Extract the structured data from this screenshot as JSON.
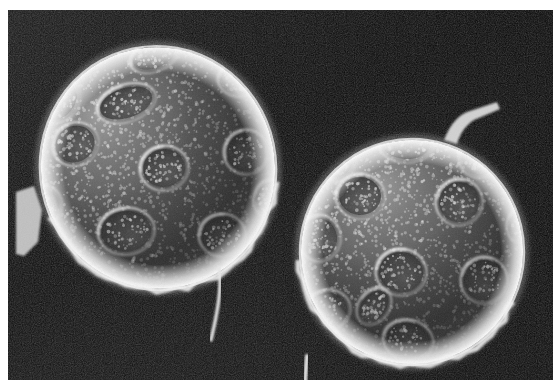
{
  "figure": {
    "kind": "scanning-electron-micrograph",
    "caption": "",
    "frame": {
      "x": 8,
      "y": 10,
      "width": 545,
      "height": 370
    },
    "page_background": "#ffffff"
  },
  "palette": {
    "page": "#ffffff",
    "background_dark": "#0a0a0a",
    "background_mid": "#1d1d1d",
    "background_lower_left": "#2e2e2e",
    "grain_body_dark": "#3a3a3a",
    "grain_body_mid": "#6f6f6f",
    "grain_highlight": "#d8d8d8",
    "grain_rim": "#f2f2f2",
    "pore_floor": "#4a4a4a",
    "pore_rim": "#e6e6e6",
    "filament": "#e8e8e8",
    "spine": "#dcdcdc"
  },
  "background": {
    "name": "specimen-stub-background",
    "top_left": "#161616",
    "top_right": "#070707",
    "bottom_left": "#303030",
    "bottom_right": "#101010",
    "noise_opacity": 0.22
  },
  "grains": [
    {
      "id": "grain-left",
      "label": "left pollen grain",
      "cx": 150,
      "cy": 158,
      "rx": 118,
      "ry": 122,
      "rotation": -12,
      "light_from": "upper-left",
      "rim_width": 11,
      "pores": [
        {
          "cx": 146,
          "cy": 46,
          "rx": 22,
          "ry": 12,
          "rot": -8,
          "depth": 0.72
        },
        {
          "cx": 52,
          "cy": 92,
          "rx": 20,
          "ry": 14,
          "rot": -38,
          "depth": 0.55
        },
        {
          "cx": 230,
          "cy": 70,
          "rx": 17,
          "ry": 13,
          "rot": 24,
          "depth": 0.6
        },
        {
          "cx": 118,
          "cy": 93,
          "rx": 27,
          "ry": 15,
          "rot": -6,
          "depth": 0.8
        },
        {
          "cx": 67,
          "cy": 134,
          "rx": 20,
          "ry": 18,
          "rot": -12,
          "depth": 0.78
        },
        {
          "cx": 156,
          "cy": 158,
          "rx": 21,
          "ry": 19,
          "rot": 6,
          "depth": 0.84
        },
        {
          "cx": 238,
          "cy": 142,
          "rx": 19,
          "ry": 19,
          "rot": 0,
          "depth": 0.7
        },
        {
          "cx": 33,
          "cy": 196,
          "rx": 18,
          "ry": 17,
          "rot": -20,
          "depth": 0.62
        },
        {
          "cx": 118,
          "cy": 221,
          "rx": 25,
          "ry": 20,
          "rot": 8,
          "depth": 0.82
        },
        {
          "cx": 214,
          "cy": 225,
          "rx": 20,
          "ry": 18,
          "rot": 14,
          "depth": 0.72
        },
        {
          "cx": 262,
          "cy": 188,
          "rx": 13,
          "ry": 16,
          "rot": 30,
          "depth": 0.45
        }
      ],
      "appendages": [
        {
          "type": "filament",
          "name": "basal-filament-left",
          "path": "M 211 258 C 214 278 210 300 203 330",
          "width": 3.4
        },
        {
          "type": "torn-flap",
          "name": "exine-fragment-left-edge",
          "path": "M 8 182 L 26 176 L 34 200 L 30 232 L 16 246 L 8 244 Z"
        }
      ]
    },
    {
      "id": "grain-right",
      "label": "right pollen grain",
      "cx": 404,
      "cy": 242,
      "rx": 112,
      "ry": 113,
      "rotation": 8,
      "light_from": "upper-left",
      "rim_width": 12,
      "pores": [
        {
          "cx": 398,
          "cy": 134,
          "rx": 24,
          "ry": 15,
          "rot": -6,
          "depth": 0.68
        },
        {
          "cx": 328,
          "cy": 153,
          "rx": 17,
          "ry": 14,
          "rot": -30,
          "depth": 0.58
        },
        {
          "cx": 470,
          "cy": 150,
          "rx": 16,
          "ry": 14,
          "rot": 22,
          "depth": 0.52
        },
        {
          "cx": 352,
          "cy": 186,
          "rx": 21,
          "ry": 19,
          "rot": -4,
          "depth": 0.8
        },
        {
          "cx": 451,
          "cy": 192,
          "rx": 20,
          "ry": 20,
          "rot": 4,
          "depth": 0.74
        },
        {
          "cx": 311,
          "cy": 228,
          "rx": 18,
          "ry": 20,
          "rot": -14,
          "depth": 0.7
        },
        {
          "cx": 516,
          "cy": 213,
          "rx": 13,
          "ry": 17,
          "rot": 18,
          "depth": 0.44
        },
        {
          "cx": 393,
          "cy": 262,
          "rx": 22,
          "ry": 20,
          "rot": 2,
          "depth": 0.86
        },
        {
          "cx": 476,
          "cy": 270,
          "rx": 20,
          "ry": 20,
          "rot": 10,
          "depth": 0.76
        },
        {
          "cx": 319,
          "cy": 300,
          "rx": 20,
          "ry": 17,
          "rot": -18,
          "depth": 0.66
        },
        {
          "cx": 400,
          "cy": 330,
          "rx": 22,
          "ry": 17,
          "rot": 6,
          "depth": 0.64
        },
        {
          "cx": 366,
          "cy": 296,
          "rx": 12,
          "ry": 17,
          "rot": 28,
          "depth": 0.55
        }
      ],
      "appendages": [
        {
          "type": "spine",
          "name": "apical-spine-right",
          "path": "M 436 130 C 443 112 452 104 462 101 L 489 92 L 492 99 L 466 110 C 457 116 452 124 449 134 Z"
        },
        {
          "type": "filament",
          "name": "basal-filament-right",
          "path": "M 299 346 C 298 358 297 368 297 379",
          "width": 4.0
        }
      ]
    }
  ],
  "surface_texture": {
    "name": "punctate-granulate-exine",
    "granule_count": 1500,
    "granule_radius_min": 0.7,
    "granule_radius_max": 1.9,
    "granule_color": "#efefef",
    "granule_opacity": 0.55
  }
}
